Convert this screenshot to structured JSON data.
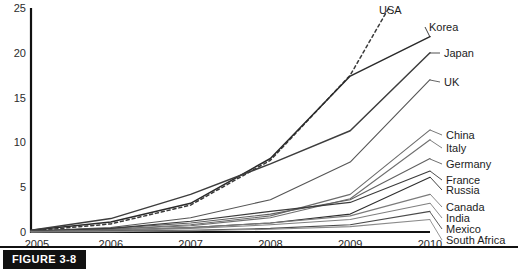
{
  "figure": {
    "caption_label": "FIGURE 3-8"
  },
  "chart_data": {
    "type": "line",
    "title": "",
    "subtitle": "",
    "xlabel": "",
    "ylabel": "",
    "x": [
      2005,
      2006,
      2007,
      2008,
      2009,
      2010
    ],
    "xtick_labels": [
      "2005",
      "2006",
      "2007",
      "2008",
      "2009",
      "2010"
    ],
    "ytick_labels": [
      "0",
      "5",
      "10",
      "15",
      "20",
      "25"
    ],
    "yticks": [
      0,
      5,
      10,
      15,
      20,
      25
    ],
    "ylim": [
      0,
      25
    ],
    "xlim": [
      2005,
      2010
    ],
    "grid": false,
    "legend_position": "right-inline-labels",
    "series": [
      {
        "name": "USA",
        "label": "USA",
        "style": "dashed",
        "color": "#3a3a3a",
        "values": [
          0.1,
          0.9,
          3.0,
          8.0,
          17.5,
          33.0
        ]
      },
      {
        "name": "Korea",
        "label": "Korea",
        "style": "solid",
        "color": "#2a2a2a",
        "values": [
          0.2,
          1.1,
          3.2,
          8.2,
          17.4,
          21.8
        ]
      },
      {
        "name": "Japan",
        "label": "Japan",
        "style": "solid",
        "color": "#3d3d3d",
        "values": [
          0.2,
          1.5,
          4.2,
          7.6,
          11.3,
          20.0
        ]
      },
      {
        "name": "UK",
        "label": "UK",
        "style": "solid",
        "color": "#555555",
        "values": [
          0.1,
          0.5,
          1.6,
          3.6,
          7.8,
          17.0
        ]
      },
      {
        "name": "China",
        "label": "China",
        "style": "solid",
        "color": "#6b6b6b",
        "values": [
          0.1,
          0.3,
          0.8,
          1.8,
          4.2,
          11.4
        ]
      },
      {
        "name": "Italy",
        "label": "Italy",
        "style": "solid",
        "color": "#6f6f6f",
        "values": [
          0.1,
          0.3,
          0.7,
          1.6,
          3.7,
          10.3
        ]
      },
      {
        "name": "Germany",
        "label": "Germany",
        "style": "solid",
        "color": "#606060",
        "values": [
          0.1,
          0.4,
          1.0,
          2.0,
          3.6,
          8.2
        ]
      },
      {
        "name": "France",
        "label": "France",
        "style": "solid",
        "color": "#3a3a3a",
        "values": [
          0.1,
          0.4,
          1.2,
          2.3,
          3.3,
          6.8
        ]
      },
      {
        "name": "Russia",
        "label": "Russia",
        "style": "solid",
        "color": "#2e2e2e",
        "values": [
          0.05,
          0.2,
          0.5,
          1.0,
          2.0,
          6.1
        ]
      },
      {
        "name": "Canada",
        "label": "Canada",
        "style": "solid",
        "color": "#7b7b7b",
        "values": [
          0.05,
          0.2,
          0.5,
          1.0,
          1.8,
          4.2
        ]
      },
      {
        "name": "India",
        "label": "India",
        "style": "solid",
        "color": "#7f7f7f",
        "values": [
          0.05,
          0.15,
          0.4,
          0.8,
          1.4,
          3.2
        ]
      },
      {
        "name": "Mexico",
        "label": "Mexico",
        "style": "solid",
        "color": "#4a4a4a",
        "values": [
          0.0,
          0.1,
          0.2,
          0.4,
          0.8,
          2.3
        ]
      },
      {
        "name": "South Africa",
        "label": "South Africa",
        "style": "solid",
        "color": "#8a8a8a",
        "values": [
          0.0,
          0.05,
          0.15,
          0.3,
          0.6,
          1.4
        ]
      }
    ]
  }
}
